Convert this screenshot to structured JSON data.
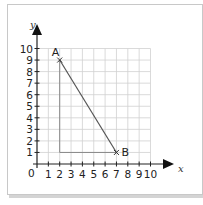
{
  "diagram": {
    "axes": {
      "x_label": "x",
      "y_label": "y",
      "origin_label": "0",
      "x_ticks": [
        "1",
        "2",
        "3",
        "4",
        "5",
        "6",
        "7",
        "8",
        "9",
        "10"
      ],
      "y_ticks": [
        "1",
        "2",
        "3",
        "4",
        "5",
        "6",
        "7",
        "8",
        "9",
        "10"
      ]
    },
    "points": [
      {
        "label": "A",
        "x": 2,
        "y": 9
      },
      {
        "label": "B",
        "x": 7,
        "y": 1
      }
    ],
    "colors": {
      "grid": "#d0d0d0",
      "axis": "#222222",
      "segment": "#555555",
      "triangle": "#888888"
    }
  },
  "chart_data": {
    "type": "scatter",
    "title": "",
    "xlabel": "x",
    "ylabel": "y",
    "xlim": [
      0,
      10
    ],
    "ylim": [
      0,
      10
    ],
    "grid": true,
    "series": [
      {
        "name": "Points",
        "x": [
          2,
          7
        ],
        "y": [
          9,
          1
        ],
        "labels": [
          "A",
          "B"
        ]
      }
    ],
    "annotations": [
      "Line segment AB from (2,9) to (7,1)",
      "Right-angle triangle legs: vertical from (2,9) to (2,1), horizontal from (2,1) to (7,1)"
    ]
  }
}
